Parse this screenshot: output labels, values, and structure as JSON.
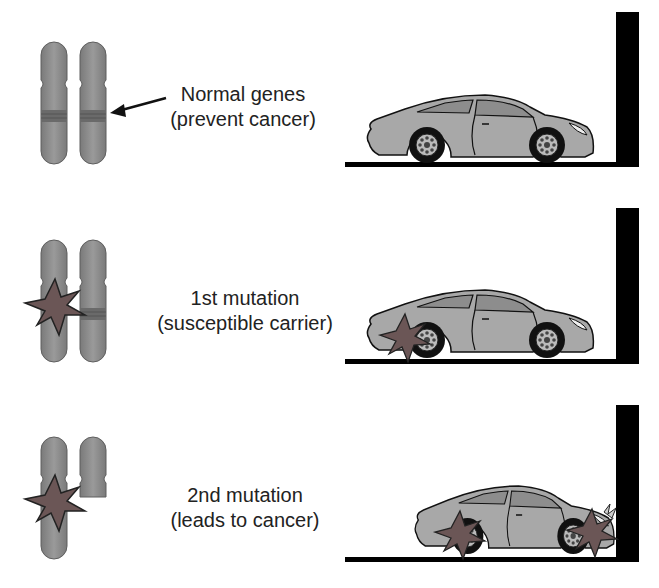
{
  "colors": {
    "chromosome": "#8c8c8c",
    "chromosome_band": "#6a6a6a",
    "mutation_star": "#6b5656",
    "car_body": "#a8a8a8",
    "car_window": "#8d8d8d",
    "wall": "#000000",
    "text": "#222222"
  },
  "rows": [
    {
      "stage": "normal",
      "label_line1": "Normal genes",
      "label_line2": "(prevent cancer)",
      "chromosomes": [
        "intact",
        "intact"
      ],
      "has_arrow": true,
      "car_state": "intact"
    },
    {
      "stage": "first-mutation",
      "label_line1": "1st mutation",
      "label_line2": "(susceptible carrier)",
      "chromosomes": [
        "mutated",
        "intact"
      ],
      "has_arrow": false,
      "car_state": "one damaged wheel"
    },
    {
      "stage": "second-mutation",
      "label_line1": "2nd mutation",
      "label_line2": "(leads to cancer)",
      "chromosomes": [
        "mutated",
        "deleted-arm"
      ],
      "has_arrow": false,
      "car_state": "both wheels damaged, crashed into wall"
    }
  ]
}
